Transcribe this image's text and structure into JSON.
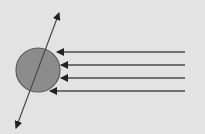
{
  "diagram": {
    "colors": {
      "background": "#e3e3e3",
      "planet_fill": "#8c8c8c",
      "planet_stroke": "#5a5a5a",
      "line": "#4a4a4a",
      "arrowhead": "#222222"
    },
    "planet": {
      "cx": 38,
      "cy": 70,
      "r": 22
    },
    "axis": {
      "x1": 16,
      "y1": 128,
      "x2": 59,
      "y2": 13,
      "double_headed": true
    },
    "rays": [
      {
        "x_start": 185,
        "y": 52,
        "x_tip": 57
      },
      {
        "x_start": 185,
        "y": 65,
        "x_tip": 61
      },
      {
        "x_start": 185,
        "y": 78,
        "x_tip": 61
      },
      {
        "x_start": 185,
        "y": 91,
        "x_tip": 50
      }
    ]
  }
}
